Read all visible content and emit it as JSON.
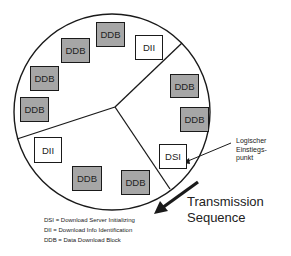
{
  "diagram": {
    "colors": {
      "outline": "#1a1a1a",
      "ddb_fill": "#a6a6a6",
      "control_fill": "#ffffff"
    },
    "blocks": [
      {
        "label": "DDB",
        "type": "data"
      },
      {
        "label": "DDB",
        "type": "data"
      },
      {
        "label": "DDB",
        "type": "data"
      },
      {
        "label": "DDB",
        "type": "data"
      },
      {
        "label": "DII",
        "type": "control"
      },
      {
        "label": "DDB",
        "type": "data"
      },
      {
        "label": "DDB",
        "type": "data"
      },
      {
        "label": "DSI",
        "type": "control"
      },
      {
        "label": "DII",
        "type": "control"
      },
      {
        "label": "DDB",
        "type": "data"
      },
      {
        "label": "DDB",
        "type": "data"
      }
    ],
    "entry_note": {
      "line1": "Logischer",
      "line2": "Einstiegs-",
      "line3": "punkt"
    },
    "direction_label": {
      "line1": "Transmission",
      "line2": "Sequence"
    },
    "legend": [
      "DSI = Download Server Initializing",
      "DII = Download Info Identification",
      "DDB = Data Download Block"
    ]
  }
}
